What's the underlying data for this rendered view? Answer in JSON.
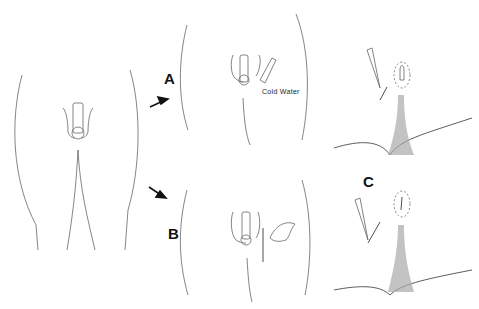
{
  "figure": {
    "type": "medical-illustration",
    "panels": [
      {
        "id": "base",
        "label": "",
        "description": "Front view of lower torso outline"
      },
      {
        "id": "A",
        "label": "A",
        "annotation": "Cold Water"
      },
      {
        "id": "B",
        "label": "B",
        "annotation": ""
      },
      {
        "id": "C",
        "label": "C",
        "annotation": ""
      }
    ],
    "colors": {
      "line": "#555555",
      "arrow": "#111111",
      "hair": "#9a9a9a",
      "background": "#ffffff"
    }
  }
}
